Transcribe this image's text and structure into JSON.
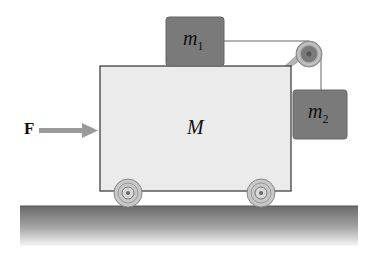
{
  "diagram": {
    "force_label": "F",
    "cart_label": "M",
    "block1": {
      "label": "m",
      "subscript": "1"
    },
    "block2": {
      "label": "m",
      "subscript": "2"
    },
    "colors": {
      "cart_fill": "#ebebeb",
      "block_fill": "#7a7a7a",
      "arrow": "#9a9a9a",
      "ground_top": "#6a6a6a",
      "ground_bottom": "#f4f4f4"
    }
  }
}
